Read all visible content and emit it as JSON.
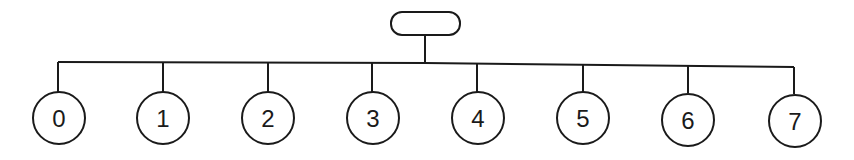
{
  "diagram": {
    "type": "tree",
    "root": {
      "label": "",
      "shape": "rounded-rectangle"
    },
    "leaves": [
      {
        "label": "0"
      },
      {
        "label": "1"
      },
      {
        "label": "2"
      },
      {
        "label": "3"
      },
      {
        "label": "4"
      },
      {
        "label": "5"
      },
      {
        "label": "6"
      },
      {
        "label": "7"
      }
    ],
    "colors": {
      "stroke": "#1a1a1a",
      "background": "#ffffff"
    }
  }
}
